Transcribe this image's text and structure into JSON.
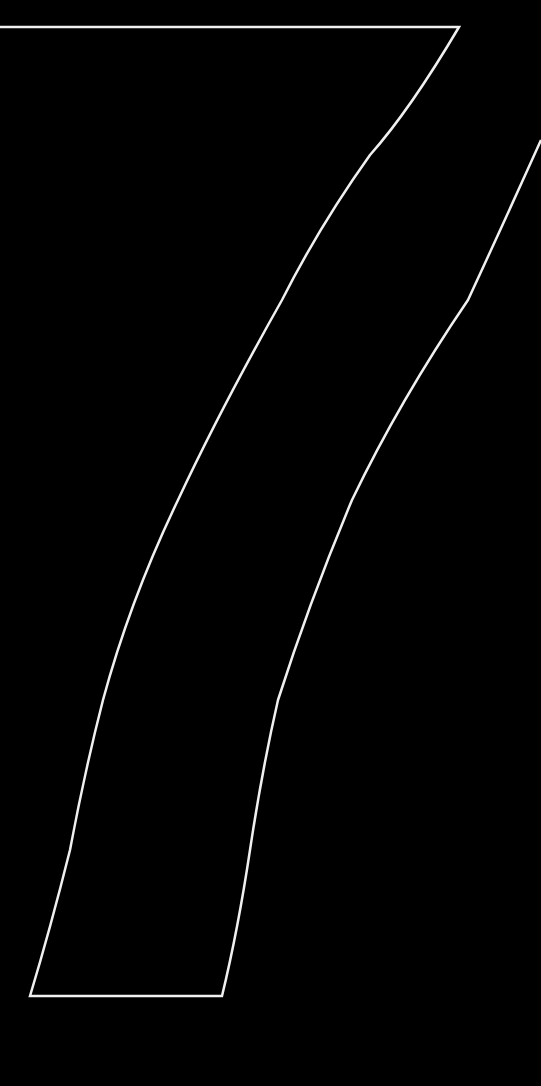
{
  "top_text": {
    "words": [
      {
        "text": "ros",
        "x": -4
      },
      {
        "text": "mo",
        "x": 80
      },
      {
        "text": "para",
        "x": 150
      },
      {
        "text": "gratitar",
        "x": 255
      },
      {
        "text": "o",
        "x": 383
      },
      {
        "text": "seu",
        "x": 422
      }
    ]
  },
  "band": {
    "stroke": "#f0f0f0",
    "lines": [
      "7 capítulos que revelam o conhecimento construído por",
      "7 dias da semana para dançar, treinar, criar, aprender",
      "7 técnicas de dança: locking, popping, e",
      "Hip-Hop dance, dance hall, house dance"
    ],
    "words": [
      {
        "text": "7",
        "x": 62,
        "y": 963,
        "a": -75
      },
      {
        "text": "capítulos",
        "x": 84,
        "y": 848,
        "a": -73
      },
      {
        "text": "que",
        "x": 127,
        "y": 712,
        "a": -70
      },
      {
        "text": "revelam",
        "x": 172,
        "y": 588,
        "a": -67
      },
      {
        "text": "o",
        "x": 216,
        "y": 490,
        "a": -64
      },
      {
        "text": "conhecimento",
        "x": 284,
        "y": 348,
        "a": -60
      },
      {
        "text": "construído",
        "x": 392,
        "y": 180,
        "a": -53
      },
      {
        "text": "por",
        "x": 456,
        "y": 52,
        "a": -47
      },
      {
        "text": "7",
        "x": 103,
        "y": 962,
        "a": -75
      },
      {
        "text": "dias",
        "x": 114,
        "y": 880,
        "a": -74
      },
      {
        "text": "da",
        "x": 142,
        "y": 805,
        "a": -72
      },
      {
        "text": "semana",
        "x": 183,
        "y": 688,
        "a": -69
      },
      {
        "text": "para",
        "x": 229,
        "y": 572,
        "a": -65
      },
      {
        "text": "dançar,",
        "x": 281,
        "y": 463,
        "a": -61
      },
      {
        "text": "treinar,",
        "x": 344,
        "y": 323,
        "a": -57
      },
      {
        "text": "criar,",
        "x": 400,
        "y": 222,
        "a": -53
      },
      {
        "text": "aprender",
        "x": 462,
        "y": 105,
        "a": -49
      },
      {
        "text": "7",
        "x": 155,
        "y": 963,
        "a": -75
      },
      {
        "text": "técnicas",
        "x": 190,
        "y": 820,
        "a": -72
      },
      {
        "text": "de",
        "x": 242,
        "y": 658,
        "a": -68
      },
      {
        "text": "dança:",
        "x": 303,
        "y": 515,
        "a": -63
      },
      {
        "text": "locking,",
        "x": 372,
        "y": 330,
        "a": -57
      },
      {
        "text": "popping,",
        "x": 452,
        "y": 170,
        "a": -50
      },
      {
        "text": "e",
        "x": 534,
        "y": 22,
        "a": -45
      },
      {
        "text": "Hip-Hop",
        "x": 212,
        "y": 918,
        "a": -74
      },
      {
        "text": "dance,",
        "x": 258,
        "y": 728,
        "a": -70
      },
      {
        "text": "dance",
        "x": 312,
        "y": 582,
        "a": -65
      },
      {
        "text": "hall,",
        "x": 376,
        "y": 440,
        "a": -60
      },
      {
        "text": "house",
        "x": 442,
        "y": 300,
        "a": -55
      },
      {
        "text": "dance",
        "x": 528,
        "y": 160,
        "a": -50
      }
    ]
  }
}
